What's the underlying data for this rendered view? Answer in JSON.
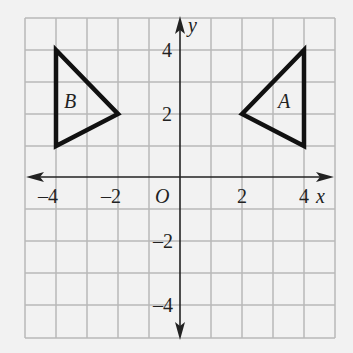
{
  "diagram": {
    "type": "coordinate-plane",
    "grid": {
      "xmin": -5,
      "xmax": 5,
      "ymin": -5,
      "ymax": 5,
      "step": 1,
      "line_color": "#b8b8b8"
    },
    "axes": {
      "x_label": "x",
      "y_label": "y",
      "origin_label": "O",
      "color": "#222222"
    },
    "x_ticks": [
      {
        "value": -4,
        "label": "–4"
      },
      {
        "value": -2,
        "label": "–2"
      },
      {
        "value": 2,
        "label": "2"
      },
      {
        "value": 4,
        "label": "4"
      }
    ],
    "y_ticks": [
      {
        "value": 4,
        "label": "4"
      },
      {
        "value": 2,
        "label": "2"
      },
      {
        "value": -2,
        "label": "–2"
      },
      {
        "value": -4,
        "label": "–4"
      }
    ],
    "shapes": [
      {
        "name": "A",
        "label": "A",
        "vertices": [
          [
            2,
            2
          ],
          [
            4,
            4
          ],
          [
            4,
            1
          ]
        ]
      },
      {
        "name": "B",
        "label": "B",
        "vertices": [
          [
            -4,
            4
          ],
          [
            -2,
            2
          ],
          [
            -4,
            1
          ]
        ]
      }
    ]
  }
}
